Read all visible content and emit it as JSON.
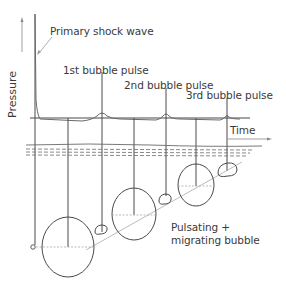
{
  "diagram": {
    "type": "underwater explosion pressure-time and bubble migration diagram",
    "axes": {
      "y_label": "Pressure",
      "x_label": "Time"
    },
    "labels": {
      "primary_shock": "Primary shock wave",
      "pulse1": "1st bubble pulse",
      "pulse2": "2nd bubble pulse",
      "pulse3": "3rd bubble pulse",
      "bubble_line1": "Pulsating +",
      "bubble_line2": "migrating bubble"
    },
    "colors": {
      "line": "#4a4a4a",
      "thin_line": "#8a8a8a",
      "text": "#3a3a3a",
      "background": "#ffffff"
    }
  }
}
